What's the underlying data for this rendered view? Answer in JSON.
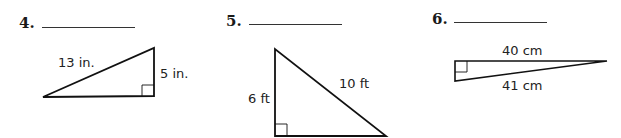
{
  "problems": [
    {
      "number": "4.",
      "answer": "",
      "shape": "right-triangle",
      "labels": {
        "hypotenuse": "13 in.",
        "leg": "5 in."
      }
    },
    {
      "number": "5.",
      "answer": "",
      "shape": "right-triangle",
      "labels": {
        "leg": "6 ft",
        "hypotenuse": "10 ft"
      }
    },
    {
      "number": "6.",
      "answer": "",
      "shape": "right-triangle",
      "labels": {
        "leg": "40 cm",
        "hypotenuse": "41 cm"
      }
    }
  ]
}
